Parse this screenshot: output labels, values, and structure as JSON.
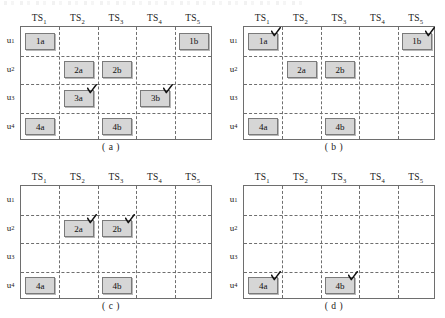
{
  "figure": {
    "columns": [
      {
        "base": "TS",
        "sub": "1"
      },
      {
        "base": "TS",
        "sub": "2"
      },
      {
        "base": "TS",
        "sub": "3"
      },
      {
        "base": "TS",
        "sub": "4"
      },
      {
        "base": "TS",
        "sub": "5"
      }
    ],
    "rows": [
      {
        "base": "u",
        "sub": "1"
      },
      {
        "base": "u",
        "sub": "2"
      },
      {
        "base": "u",
        "sub": "3"
      },
      {
        "base": "u",
        "sub": "4"
      }
    ],
    "colors": {
      "box_fill": "#d6d6d6",
      "box_border": "#7a7a7a",
      "frame": "#6e6e6e",
      "grid_dash": "#6e6e6e",
      "background": "#ffffff",
      "text": "#111111"
    },
    "panels": [
      {
        "id": "a",
        "caption": "( a )",
        "boxes": [
          {
            "label": "1a",
            "row": 1,
            "col": 1,
            "checked": false
          },
          {
            "label": "1b",
            "row": 1,
            "col": 5,
            "checked": false
          },
          {
            "label": "2a",
            "row": 2,
            "col": 2,
            "checked": false
          },
          {
            "label": "2b",
            "row": 2,
            "col": 3,
            "checked": false
          },
          {
            "label": "3a",
            "row": 3,
            "col": 2,
            "checked": true
          },
          {
            "label": "3b",
            "row": 3,
            "col": 4,
            "checked": true
          },
          {
            "label": "4a",
            "row": 4,
            "col": 1,
            "checked": false
          },
          {
            "label": "4b",
            "row": 4,
            "col": 3,
            "checked": false
          }
        ]
      },
      {
        "id": "b",
        "caption": "( b )",
        "boxes": [
          {
            "label": "1a",
            "row": 1,
            "col": 1,
            "checked": true
          },
          {
            "label": "1b",
            "row": 1,
            "col": 5,
            "checked": true
          },
          {
            "label": "2a",
            "row": 2,
            "col": 2,
            "checked": false
          },
          {
            "label": "2b",
            "row": 2,
            "col": 3,
            "checked": false
          },
          {
            "label": "4a",
            "row": 4,
            "col": 1,
            "checked": false
          },
          {
            "label": "4b",
            "row": 4,
            "col": 3,
            "checked": false
          }
        ]
      },
      {
        "id": "c",
        "caption": "( c )",
        "boxes": [
          {
            "label": "2a",
            "row": 2,
            "col": 2,
            "checked": true
          },
          {
            "label": "2b",
            "row": 2,
            "col": 3,
            "checked": true
          },
          {
            "label": "4a",
            "row": 4,
            "col": 1,
            "checked": false
          },
          {
            "label": "4b",
            "row": 4,
            "col": 3,
            "checked": false
          }
        ]
      },
      {
        "id": "d",
        "caption": "( d )",
        "boxes": [
          {
            "label": "4a",
            "row": 4,
            "col": 1,
            "checked": true
          },
          {
            "label": "4b",
            "row": 4,
            "col": 3,
            "checked": true
          }
        ]
      }
    ]
  }
}
